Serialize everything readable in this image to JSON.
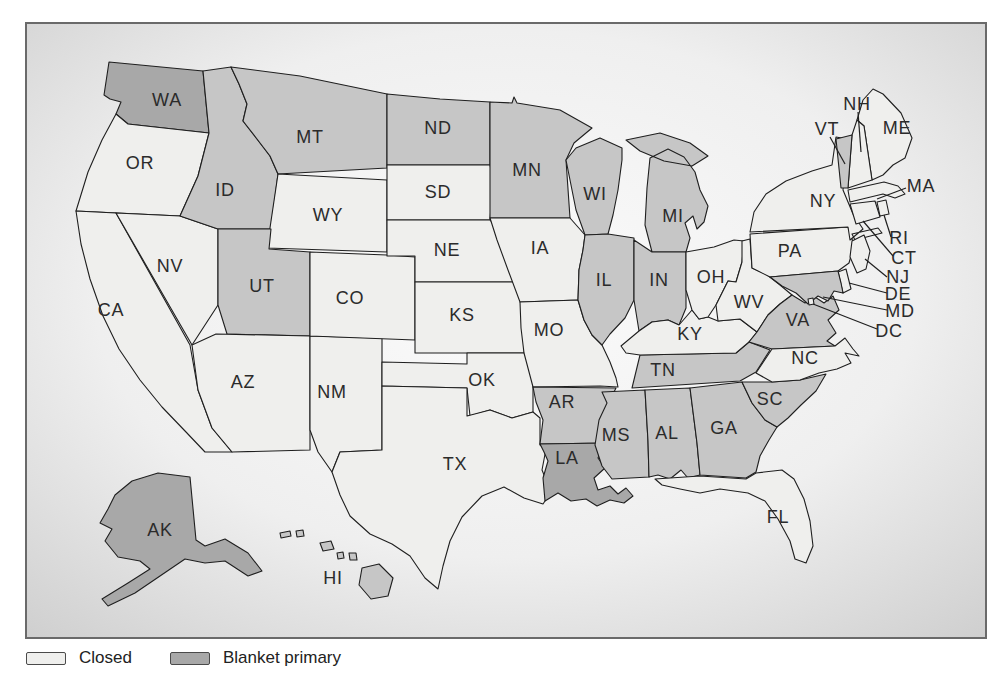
{
  "figure": {
    "legend": {
      "items": [
        {
          "label": "Closed",
          "category": "closed"
        },
        {
          "label": "Blanket primary",
          "category": "blanket"
        }
      ]
    },
    "colors": {
      "closed": "#efefed",
      "medium": "#c6c6c6",
      "blanket": "#a8a8a8",
      "stroke": "#1f1f1f",
      "leader": "#1f1f1f",
      "label": "#2b2b2b",
      "frame": "#6a6a6a",
      "panel_center": "#fbfbfb",
      "panel_edge": "#cccccc"
    },
    "states": [
      {
        "abbr": "WA",
        "category": "blanket",
        "label": [
          167,
          100
        ]
      },
      {
        "abbr": "OR",
        "category": "closed",
        "label": [
          140,
          163
        ]
      },
      {
        "abbr": "CA",
        "category": "closed",
        "label": [
          111,
          310
        ]
      },
      {
        "abbr": "NV",
        "category": "closed",
        "label": [
          170,
          266
        ]
      },
      {
        "abbr": "ID",
        "category": "medium",
        "label": [
          225,
          190
        ]
      },
      {
        "abbr": "MT",
        "category": "medium",
        "label": [
          310,
          137
        ]
      },
      {
        "abbr": "WY",
        "category": "closed",
        "label": [
          328,
          215
        ]
      },
      {
        "abbr": "UT",
        "category": "medium",
        "label": [
          262,
          286
        ]
      },
      {
        "abbr": "AZ",
        "category": "closed",
        "label": [
          243,
          382
        ]
      },
      {
        "abbr": "NM",
        "category": "closed",
        "label": [
          332,
          392
        ]
      },
      {
        "abbr": "CO",
        "category": "closed",
        "label": [
          350,
          298
        ]
      },
      {
        "abbr": "ND",
        "category": "medium",
        "label": [
          438,
          128
        ]
      },
      {
        "abbr": "SD",
        "category": "closed",
        "label": [
          438,
          192
        ]
      },
      {
        "abbr": "NE",
        "category": "closed",
        "label": [
          447,
          250
        ]
      },
      {
        "abbr": "KS",
        "category": "closed",
        "label": [
          462,
          315
        ]
      },
      {
        "abbr": "OK",
        "category": "closed",
        "label": [
          482,
          380
        ]
      },
      {
        "abbr": "TX",
        "category": "closed",
        "label": [
          455,
          464
        ]
      },
      {
        "abbr": "MN",
        "category": "medium",
        "label": [
          527,
          170
        ]
      },
      {
        "abbr": "IA",
        "category": "closed",
        "label": [
          540,
          248
        ]
      },
      {
        "abbr": "MO",
        "category": "closed",
        "label": [
          549,
          330
        ]
      },
      {
        "abbr": "AR",
        "category": "medium",
        "label": [
          562,
          402
        ]
      },
      {
        "abbr": "LA",
        "category": "blanket",
        "label": [
          567,
          458
        ]
      },
      {
        "abbr": "WI",
        "category": "medium",
        "label": [
          595,
          194
        ]
      },
      {
        "abbr": "IL",
        "category": "medium",
        "label": [
          604,
          280
        ]
      },
      {
        "abbr": "MS",
        "category": "medium",
        "label": [
          616,
          435
        ]
      },
      {
        "abbr": "MI",
        "category": "medium",
        "label": [
          673,
          216
        ]
      },
      {
        "abbr": "IN",
        "category": "medium",
        "label": [
          659,
          280
        ]
      },
      {
        "abbr": "AL",
        "category": "medium",
        "label": [
          667,
          433
        ]
      },
      {
        "abbr": "TN",
        "category": "medium",
        "label": [
          663,
          370
        ]
      },
      {
        "abbr": "KY",
        "category": "closed",
        "label": [
          690,
          334
        ]
      },
      {
        "abbr": "OH",
        "category": "closed",
        "label": [
          711,
          277
        ]
      },
      {
        "abbr": "GA",
        "category": "medium",
        "label": [
          724,
          428
        ]
      },
      {
        "abbr": "WV",
        "category": "closed",
        "label": [
          749,
          302
        ]
      },
      {
        "abbr": "SC",
        "category": "medium",
        "label": [
          770,
          399
        ]
      },
      {
        "abbr": "FL",
        "category": "closed",
        "label": [
          778,
          517
        ]
      },
      {
        "abbr": "PA",
        "category": "closed",
        "label": [
          790,
          251
        ]
      },
      {
        "abbr": "VA",
        "category": "medium",
        "label": [
          798,
          320
        ]
      },
      {
        "abbr": "NC",
        "category": "closed",
        "label": [
          805,
          358
        ]
      },
      {
        "abbr": "NY",
        "category": "closed",
        "label": [
          823,
          201
        ]
      },
      {
        "abbr": "AK",
        "category": "blanket",
        "label": [
          160,
          530
        ]
      },
      {
        "abbr": "HI",
        "category": "medium",
        "label": [
          333,
          578
        ]
      },
      {
        "abbr": "ME",
        "category": "closed",
        "label": [
          897,
          128
        ]
      },
      {
        "abbr": "NH",
        "category": "closed",
        "label": [
          857,
          104
        ],
        "leader": [
          [
            858,
            112
          ],
          [
            861,
            152
          ]
        ]
      },
      {
        "abbr": "VT",
        "category": "medium",
        "label": [
          827,
          129
        ],
        "leader": [
          [
            830,
            137
          ],
          [
            845,
            164
          ]
        ]
      },
      {
        "abbr": "MA",
        "category": "closed",
        "label": [
          921,
          186
        ],
        "leader": [
          [
            906,
            188
          ],
          [
            877,
            199
          ]
        ]
      },
      {
        "abbr": "RI",
        "category": "closed",
        "label": [
          899,
          238
        ],
        "leader": [
          [
            891,
            237
          ],
          [
            884,
            215
          ]
        ]
      },
      {
        "abbr": "CT",
        "category": "closed",
        "label": [
          904,
          258
        ],
        "leader": [
          [
            893,
            256
          ],
          [
            863,
            221
          ]
        ]
      },
      {
        "abbr": "NJ",
        "category": "closed",
        "label": [
          898,
          277
        ],
        "leader": [
          [
            887,
            277
          ],
          [
            865,
            259
          ]
        ]
      },
      {
        "abbr": "DE",
        "category": "closed",
        "label": [
          898,
          294
        ],
        "leader": [
          [
            887,
            293
          ],
          [
            849,
            283
          ]
        ]
      },
      {
        "abbr": "MD",
        "category": "medium",
        "label": [
          900,
          311
        ],
        "leader": [
          [
            887,
            310
          ],
          [
            823,
            297
          ]
        ]
      },
      {
        "abbr": "DC",
        "category": "closed",
        "label": [
          889,
          331
        ],
        "leader": [
          [
            877,
            329
          ],
          [
            813,
            304
          ]
        ]
      }
    ]
  }
}
